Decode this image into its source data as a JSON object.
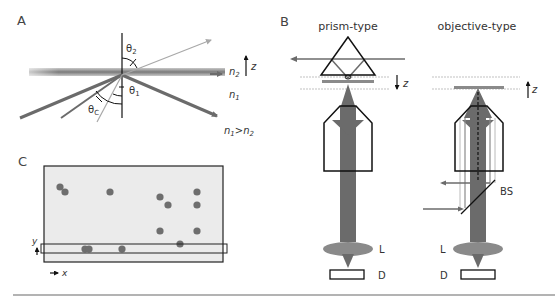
{
  "panels": {
    "A": {
      "label": "A",
      "angles": {
        "theta2": "θ",
        "theta2_sub": "2",
        "theta1": "θ",
        "theta1_sub": "1",
        "thetac": "θ",
        "thetac_sub": "C"
      },
      "media": {
        "n2": "n",
        "n2_sub": "2",
        "n1": "n",
        "n1_sub": "1"
      },
      "condition": {
        "a": "n",
        "a_sub": "1",
        "gt": ">",
        "b": "n",
        "b_sub": "2"
      },
      "axis": "z"
    },
    "B": {
      "label": "B",
      "prism_title": "prism-type",
      "objective_title": "objective-type",
      "axis_prism": "z",
      "axis_objective": "z",
      "lens_label": "L",
      "detector_label": "D",
      "beamsplitter_label": "BS"
    },
    "C": {
      "label": "C",
      "axis_y": "y",
      "axis_x": "x",
      "spots": [
        {
          "x": 60,
          "y": 187
        },
        {
          "x": 65,
          "y": 192
        },
        {
          "x": 110,
          "y": 192
        },
        {
          "x": 160,
          "y": 197
        },
        {
          "x": 168,
          "y": 205
        },
        {
          "x": 197,
          "y": 192
        },
        {
          "x": 197,
          "y": 205
        },
        {
          "x": 160,
          "y": 231
        },
        {
          "x": 197,
          "y": 231
        },
        {
          "x": 180,
          "y": 244
        },
        {
          "x": 85,
          "y": 249
        },
        {
          "x": 89,
          "y": 249
        },
        {
          "x": 122,
          "y": 249
        }
      ]
    }
  },
  "colors": {
    "beam": "#6b6b6b",
    "beam_light": "#a8a8a8",
    "outline": "#111111",
    "field": "#ebebeb",
    "spot": "#6e6e6e"
  }
}
